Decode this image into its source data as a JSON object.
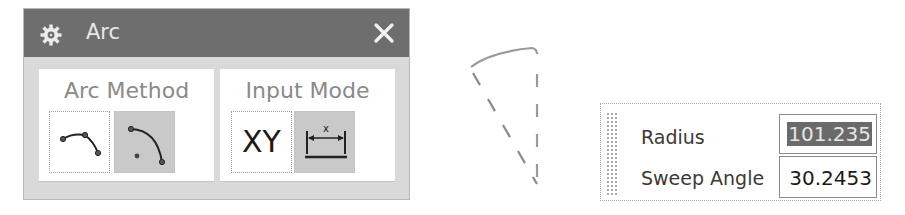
{
  "dialog": {
    "title": "Arc",
    "icon": "gear-icon",
    "close_icon": "close-icon",
    "title_bar_color": "#6e6e6e",
    "arc_method": {
      "label": "Arc Method",
      "options": [
        {
          "name": "three-point-arc",
          "icon": "three-point-arc-icon",
          "selected": false
        },
        {
          "name": "center-endpoints-arc",
          "icon": "center-arc-icon",
          "selected": true
        }
      ]
    },
    "input_mode": {
      "label": "Input Mode",
      "options": [
        {
          "name": "coordinate",
          "label": "XY",
          "selected": false
        },
        {
          "name": "parameter",
          "icon": "dimension-icon",
          "icon_label": "x",
          "selected": true
        }
      ]
    }
  },
  "preview": {
    "description": "arc preview with dashed radius lines"
  },
  "dynamic_input": {
    "fields": [
      {
        "label": "Radius",
        "value": "101.235",
        "selected": true
      },
      {
        "label": "Sweep Angle",
        "value": "30.2453",
        "selected": false
      }
    ]
  }
}
